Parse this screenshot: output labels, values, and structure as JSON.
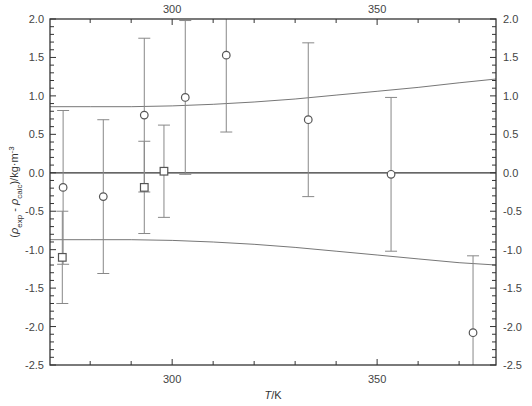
{
  "chart_data": {
    "type": "scatter",
    "title": "",
    "xlabel": "T/K",
    "ylabel": "(ρexp - ρcalc)/kg·m-3",
    "xlim": [
      270.2,
      379
    ],
    "ylim": [
      -2.5,
      2.0
    ],
    "x_ticks_major": [
      300,
      350
    ],
    "x_ticks_minor": [
      280,
      290,
      310,
      320,
      330,
      340,
      360,
      370
    ],
    "y_ticks": [
      -2.5,
      -2.0,
      -1.5,
      -1.0,
      -0.5,
      0.0,
      0.5,
      1.0,
      1.5,
      2.0
    ],
    "y_tick_labels": [
      "-2.5",
      "-2.0",
      "-1.5",
      "-1.0",
      "-0.5",
      "0.0",
      "0.5",
      "1.0",
      "1.5",
      "2.0"
    ],
    "grid": false,
    "zero_line": true,
    "mirror_axes": true,
    "series": [
      {
        "name": "circles",
        "marker": "circle",
        "x": [
          273.4,
          283.2,
          293.2,
          303.2,
          313.2,
          333.2,
          353.4,
          373.4
        ],
        "y": [
          -0.19,
          -0.31,
          0.75,
          0.98,
          1.53,
          0.69,
          -0.02,
          -2.08
        ],
        "err": [
          1.0,
          1.0,
          1.0,
          1.0,
          1.0,
          1.0,
          1.0,
          1.0
        ]
      },
      {
        "name": "squares",
        "marker": "square",
        "x": [
          273.2,
          293.2,
          298.0
        ],
        "y": [
          -1.1,
          -0.19,
          0.02
        ],
        "err": [
          0.6,
          0.6,
          0.6
        ]
      }
    ],
    "bands": {
      "name": "uncertainty bounds",
      "x": [
        270.2,
        280,
        290,
        300,
        310,
        320,
        330,
        340,
        350,
        360,
        370,
        379
      ],
      "upper": [
        0.86,
        0.86,
        0.86,
        0.87,
        0.89,
        0.92,
        0.96,
        1.01,
        1.06,
        1.11,
        1.17,
        1.22
      ],
      "lower": [
        -0.87,
        -0.87,
        -0.87,
        -0.88,
        -0.9,
        -0.93,
        -0.97,
        -1.02,
        -1.07,
        -1.12,
        -1.17,
        -1.2
      ]
    }
  },
  "colors": {
    "axis": "#333333",
    "data": "#555555",
    "errorbar": "#888888",
    "band": "#777777",
    "zero": "#333333"
  }
}
